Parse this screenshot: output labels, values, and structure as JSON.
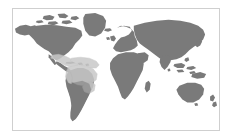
{
  "figure": {
    "kind": "world-distribution-map",
    "title": "",
    "caption": "",
    "width": 232,
    "height": 140,
    "background_color": "#ffffff"
  },
  "map": {
    "projection": "equirectangular",
    "frame": {
      "x": 12,
      "y": 8,
      "width": 208,
      "height": 123,
      "border_color": "#cfcfcf",
      "border_width": 1,
      "fill_color": "#ffffff"
    },
    "extent": {
      "lon_min": -180,
      "lon_max": 180,
      "lat_min": -58,
      "lat_max": 84
    },
    "graticule_visible": false,
    "labels_visible": false,
    "legend_visible": false
  },
  "layers": [
    {
      "name": "landmass",
      "label": "Land",
      "fill_color": "#7a7a7a",
      "stroke_color": "#7a7a7a",
      "opacity": 1
    },
    {
      "name": "range-overlay",
      "label": "Distribution range",
      "fill_color": "#c8c8c8",
      "stroke_color": "#bdbdbd",
      "opacity": 0.85,
      "regions": [
        "Central America",
        "Caribbean",
        "Northern South America",
        "Amazon Basin",
        "Southeastern Brazil"
      ]
    }
  ],
  "continents": [
    {
      "name": "North America",
      "highlighted": false
    },
    {
      "name": "Greenland",
      "highlighted": false
    },
    {
      "name": "Central America",
      "highlighted": true
    },
    {
      "name": "South America",
      "highlighted": true
    },
    {
      "name": "Europe",
      "highlighted": false
    },
    {
      "name": "Africa",
      "highlighted": false
    },
    {
      "name": "Asia",
      "highlighted": false
    },
    {
      "name": "Australia",
      "highlighted": false
    },
    {
      "name": "New Zealand",
      "highlighted": false
    },
    {
      "name": "Madagascar",
      "highlighted": false
    },
    {
      "name": "Japan",
      "highlighted": false
    },
    {
      "name": "Indonesia",
      "highlighted": false
    },
    {
      "name": "British Isles",
      "highlighted": false
    }
  ]
}
